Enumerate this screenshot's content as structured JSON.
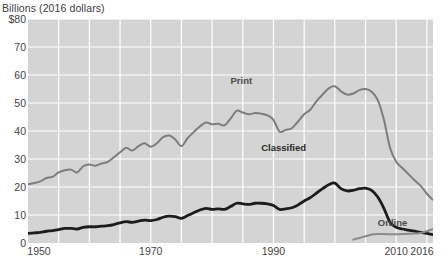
{
  "chart_data": {
    "type": "line",
    "title": "Billions (2016 dollars)",
    "xlabel": "",
    "ylabel": "Billions (2016 dollars)",
    "xlim": [
      1950,
      2016
    ],
    "ylim": [
      0,
      80
    ],
    "yticks": [
      0,
      10,
      20,
      30,
      40,
      50,
      60,
      70,
      80
    ],
    "ytick_labels": [
      "0",
      "10",
      "20",
      "30",
      "40",
      "50",
      "60",
      "70",
      "$80"
    ],
    "xticks": [
      1950,
      1970,
      1990,
      2010,
      2016
    ],
    "xtick_labels": [
      "1950",
      "1970",
      "1990",
      "2010",
      "2016"
    ],
    "grid": true,
    "grid_color": "#ffffff",
    "plot_background": "#d4d4d4",
    "legend": "inline-annotations",
    "x": [
      1950,
      1951,
      1952,
      1953,
      1954,
      1955,
      1956,
      1957,
      1958,
      1959,
      1960,
      1961,
      1962,
      1963,
      1964,
      1965,
      1966,
      1967,
      1968,
      1969,
      1970,
      1971,
      1972,
      1973,
      1974,
      1975,
      1976,
      1977,
      1978,
      1979,
      1980,
      1981,
      1982,
      1983,
      1984,
      1985,
      1986,
      1987,
      1988,
      1989,
      1990,
      1991,
      1992,
      1993,
      1994,
      1995,
      1996,
      1997,
      1998,
      1999,
      2000,
      2001,
      2002,
      2003,
      2004,
      2005,
      2006,
      2007,
      2008,
      2009,
      2010,
      2011,
      2012,
      2013,
      2014,
      2015,
      2016
    ],
    "series": [
      {
        "name": "Print",
        "color": "#7d7d7d",
        "width": 2.0,
        "label_x": 1983,
        "label_y": 58,
        "values": [
          21.0,
          21.4,
          22.0,
          23.2,
          23.6,
          25.2,
          26.0,
          26.2,
          25.2,
          27.4,
          28.0,
          27.6,
          28.4,
          29.0,
          30.6,
          32.4,
          34.0,
          33.0,
          34.6,
          35.6,
          34.4,
          35.6,
          37.8,
          38.4,
          37.0,
          34.6,
          37.4,
          39.6,
          41.6,
          43.0,
          42.4,
          42.6,
          42.0,
          44.4,
          47.2,
          46.6,
          46.0,
          46.4,
          46.2,
          45.6,
          44.0,
          39.8,
          40.4,
          41.0,
          43.4,
          46.0,
          47.6,
          50.6,
          53.0,
          55.2,
          56.0,
          54.2,
          53.0,
          53.4,
          54.6,
          55.0,
          54.0,
          51.0,
          44.0,
          34.0,
          29.0,
          26.8,
          24.6,
          22.4,
          20.4,
          17.6,
          15.4
        ]
      },
      {
        "name": "Classified",
        "color": "#1c1c1c",
        "width": 2.8,
        "label_x": 1988,
        "label_y": 34,
        "values": [
          3.4,
          3.6,
          3.8,
          4.2,
          4.4,
          4.8,
          5.2,
          5.2,
          5.0,
          5.6,
          5.8,
          5.8,
          6.0,
          6.2,
          6.6,
          7.2,
          7.6,
          7.4,
          7.8,
          8.2,
          8.0,
          8.4,
          9.2,
          9.6,
          9.4,
          8.8,
          9.8,
          10.8,
          11.8,
          12.4,
          12.0,
          12.2,
          12.0,
          13.0,
          14.2,
          14.0,
          13.8,
          14.2,
          14.2,
          14.0,
          13.4,
          12.0,
          12.2,
          12.6,
          13.6,
          15.0,
          16.2,
          17.8,
          19.4,
          20.8,
          21.4,
          19.4,
          18.6,
          18.8,
          19.4,
          19.6,
          18.8,
          16.4,
          12.4,
          7.4,
          5.6,
          5.0,
          4.6,
          4.2,
          3.8,
          3.4,
          3.0
        ]
      },
      {
        "name": "Online",
        "color": "#8a8a8a",
        "width": 2.0,
        "label_x": 2007,
        "label_y": 7,
        "values": [
          null,
          null,
          null,
          null,
          null,
          null,
          null,
          null,
          null,
          null,
          null,
          null,
          null,
          null,
          null,
          null,
          null,
          null,
          null,
          null,
          null,
          null,
          null,
          null,
          null,
          null,
          null,
          null,
          null,
          null,
          null,
          null,
          null,
          null,
          null,
          null,
          null,
          null,
          null,
          null,
          null,
          null,
          null,
          null,
          null,
          null,
          null,
          null,
          null,
          null,
          null,
          null,
          null,
          1.2,
          1.8,
          2.4,
          3.0,
          3.2,
          3.2,
          3.1,
          3.1,
          3.2,
          3.3,
          3.4,
          3.6,
          4.2,
          5.0
        ]
      }
    ]
  }
}
